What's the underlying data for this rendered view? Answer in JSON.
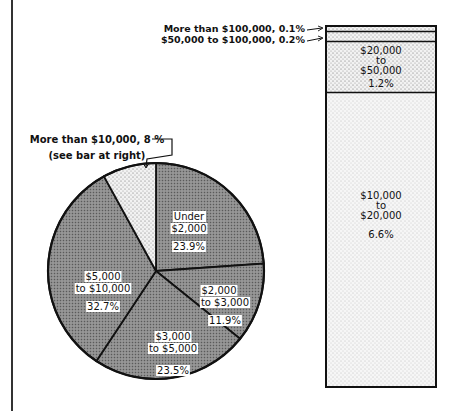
{
  "chart_data": [
    {
      "type": "pie",
      "title": "",
      "start_angle": "12 o'clock, clockwise",
      "slices": [
        {
          "label": "Under $2,000",
          "label_lines": [
            "Under",
            "$2,000"
          ],
          "value": 23.9,
          "value_label": "23.9%"
        },
        {
          "label": "$2,000 to $3,000",
          "label_lines": [
            "$2,000",
            "to $3,000"
          ],
          "value": 11.9,
          "value_label": "11.9%"
        },
        {
          "label": "$3,000 to $5,000",
          "label_lines": [
            "$3,000",
            "to $5,000"
          ],
          "value": 23.5,
          "value_label": "23.5%"
        },
        {
          "label": "$5,000 to $10,000",
          "label_lines": [
            "$5,000",
            "to $10,000"
          ],
          "value": 32.7,
          "value_label": "32.7%"
        },
        {
          "label": "More than $10,000",
          "value": 8,
          "value_label": "8 %"
        }
      ],
      "annotation": {
        "line1": "More than $10,000, 8 %",
        "line2": "(see bar at right)"
      }
    },
    {
      "type": "bar",
      "orientation": "stacked-vertical",
      "total_represented": 8,
      "segments": [
        {
          "label": "$10,000 to $20,000",
          "label_lines": [
            "$10,000",
            "to",
            "$20,000"
          ],
          "value": 6.6,
          "value_label": "6.6%"
        },
        {
          "label": "$20,000 to $50,000",
          "label_lines": [
            "$20,000",
            "to",
            "$50,000"
          ],
          "value": 1.2,
          "value_label": "1.2%"
        },
        {
          "label": "$50,000 to $100,000",
          "value": 0.2,
          "value_label": "0.2%",
          "callout": "$50,000 to $100,000, 0.2%"
        },
        {
          "label": "More than $100,000",
          "value": 0.1,
          "value_label": "0.1%",
          "callout": "More than $100,000, 0.1%"
        }
      ]
    }
  ]
}
